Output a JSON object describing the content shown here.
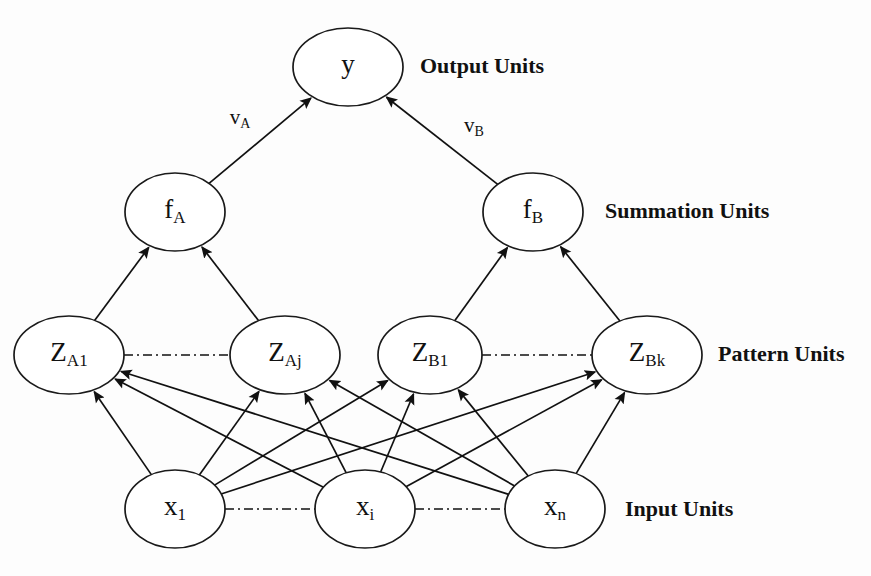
{
  "figure": {
    "background_color": "#fdfdfd",
    "stroke_color": "#111111",
    "node_fill": "#ffffff"
  },
  "layers": [
    {
      "id": "output",
      "label": "Output Units",
      "label_x": 420,
      "label_y": 68,
      "nodes": [
        {
          "id": "y",
          "base": "y",
          "sub": "",
          "cx": 348,
          "cy": 67,
          "rx": 55,
          "ry": 39
        }
      ]
    },
    {
      "id": "summation",
      "label": "Summation Units",
      "label_x": 605,
      "label_y": 213,
      "nodes": [
        {
          "id": "fA",
          "base": "f",
          "sub": "A",
          "cx": 175,
          "cy": 212,
          "rx": 50,
          "ry": 39
        },
        {
          "id": "fB",
          "base": "f",
          "sub": "B",
          "cx": 533,
          "cy": 212,
          "rx": 50,
          "ry": 39
        }
      ]
    },
    {
      "id": "pattern",
      "label": "Pattern Units",
      "label_x": 718,
      "label_y": 356,
      "nodes": [
        {
          "id": "ZA1",
          "base": "Z",
          "sub": "A1",
          "cx": 69,
          "cy": 355,
          "rx": 55,
          "ry": 39
        },
        {
          "id": "ZAj",
          "base": "Z",
          "sub": "Aj",
          "cx": 285,
          "cy": 355,
          "rx": 55,
          "ry": 39
        },
        {
          "id": "ZB1",
          "base": "Z",
          "sub": "B1",
          "cx": 430,
          "cy": 355,
          "rx": 52,
          "ry": 39
        },
        {
          "id": "ZBk",
          "base": "Z",
          "sub": "Bk",
          "cx": 647,
          "cy": 355,
          "rx": 55,
          "ry": 39
        }
      ]
    },
    {
      "id": "input",
      "label": "Input Units",
      "label_x": 625,
      "label_y": 511,
      "nodes": [
        {
          "id": "x1",
          "base": "x",
          "sub": "1",
          "cx": 175,
          "cy": 509,
          "rx": 50,
          "ry": 39
        },
        {
          "id": "xi",
          "base": "x",
          "sub": "i",
          "cx": 365,
          "cy": 509,
          "rx": 50,
          "ry": 39
        },
        {
          "id": "xn",
          "base": "x",
          "sub": "n",
          "cx": 555,
          "cy": 509,
          "rx": 50,
          "ry": 39
        }
      ]
    }
  ],
  "edges": [
    {
      "from": "fA",
      "to": "y",
      "style": "arrow",
      "label_base": "v",
      "label_sub": "A",
      "label_x": 240,
      "label_y": 119
    },
    {
      "from": "fB",
      "to": "y",
      "style": "arrow",
      "label_base": "v",
      "label_sub": "B",
      "label_x": 474,
      "label_y": 127
    },
    {
      "from": "ZA1",
      "to": "fA",
      "style": "arrow",
      "label_base": "",
      "label_sub": ""
    },
    {
      "from": "ZAj",
      "to": "fA",
      "style": "arrow",
      "label_base": "",
      "label_sub": ""
    },
    {
      "from": "ZB1",
      "to": "fB",
      "style": "arrow",
      "label_base": "",
      "label_sub": ""
    },
    {
      "from": "ZBk",
      "to": "fB",
      "style": "arrow",
      "label_base": "",
      "label_sub": ""
    },
    {
      "from": "x1",
      "to": "ZA1",
      "style": "arrow",
      "label_base": "",
      "label_sub": ""
    },
    {
      "from": "x1",
      "to": "ZAj",
      "style": "arrow",
      "label_base": "",
      "label_sub": ""
    },
    {
      "from": "x1",
      "to": "ZB1",
      "style": "arrow",
      "label_base": "",
      "label_sub": ""
    },
    {
      "from": "x1",
      "to": "ZBk",
      "style": "arrow",
      "label_base": "",
      "label_sub": ""
    },
    {
      "from": "xi",
      "to": "ZA1",
      "style": "arrow",
      "label_base": "",
      "label_sub": ""
    },
    {
      "from": "xi",
      "to": "ZAj",
      "style": "arrow",
      "label_base": "",
      "label_sub": ""
    },
    {
      "from": "xi",
      "to": "ZB1",
      "style": "arrow",
      "label_base": "",
      "label_sub": ""
    },
    {
      "from": "xi",
      "to": "ZBk",
      "style": "arrow",
      "label_base": "",
      "label_sub": ""
    },
    {
      "from": "xn",
      "to": "ZA1",
      "style": "arrow",
      "label_base": "",
      "label_sub": ""
    },
    {
      "from": "xn",
      "to": "ZAj",
      "style": "arrow",
      "label_base": "",
      "label_sub": ""
    },
    {
      "from": "xn",
      "to": "ZB1",
      "style": "arrow",
      "label_base": "",
      "label_sub": ""
    },
    {
      "from": "xn",
      "to": "ZBk",
      "style": "arrow",
      "label_base": "",
      "label_sub": ""
    },
    {
      "from": "ZA1",
      "to": "ZAj",
      "style": "dashdot",
      "label_base": "",
      "label_sub": ""
    },
    {
      "from": "ZB1",
      "to": "ZBk",
      "style": "dashdot",
      "label_base": "",
      "label_sub": ""
    },
    {
      "from": "x1",
      "to": "xi",
      "style": "dashdot",
      "label_base": "",
      "label_sub": ""
    },
    {
      "from": "xi",
      "to": "xn",
      "style": "dashdot",
      "label_base": "",
      "label_sub": ""
    }
  ]
}
